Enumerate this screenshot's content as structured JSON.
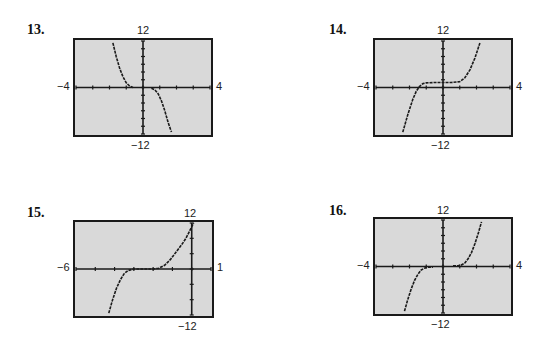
{
  "plot_style": {
    "background": "#d9d9d9",
    "frame": "#1a1a1a",
    "curve": "#1a1a1a",
    "axis": "#1a1a1a"
  },
  "chart_data": [
    {
      "type": "line",
      "label": "13.",
      "title": "",
      "xlim": [
        -4,
        4
      ],
      "ylim": [
        -12,
        12
      ],
      "tick_labels": {
        "xmin": "−4",
        "xmax": "4",
        "ymax": "12",
        "ymin": "−12"
      },
      "x_ticks_step": 1,
      "y_ticks_step": 2,
      "grid": false,
      "series": [
        {
          "name": "left branch",
          "x": [
            -1.8,
            -1.6,
            -1.4,
            -1.2,
            -1.0,
            -0.8,
            -0.6
          ],
          "y": [
            11.5,
            8,
            5,
            2.8,
            1.2,
            0.4,
            0
          ]
        },
        {
          "name": "right branch",
          "x": [
            0.5,
            0.7,
            0.9,
            1.1,
            1.3,
            1.5,
            1.7
          ],
          "y": [
            -0.2,
            -0.6,
            -1.6,
            -3.4,
            -6,
            -9,
            -11.5
          ]
        }
      ]
    },
    {
      "type": "line",
      "label": "14.",
      "title": "",
      "xlim": [
        -4,
        4
      ],
      "ylim": [
        -12,
        12
      ],
      "tick_labels": {
        "xmin": "−4",
        "xmax": "4",
        "ymax": "12",
        "ymin": "−12"
      },
      "x_ticks_step": 1,
      "y_ticks_step": 2,
      "grid": false,
      "series": [
        {
          "name": "curve",
          "x": [
            -2.4,
            -2.1,
            -1.8,
            -1.6,
            -1.4,
            -1.2,
            -1.0,
            -0.5,
            0,
            0.5,
            1.0,
            1.3,
            1.6,
            1.9,
            2.2
          ],
          "y": [
            -11.5,
            -7,
            -3,
            -1,
            0.3,
            1,
            1.2,
            1.3,
            1.3,
            1.3,
            1.5,
            2.5,
            4.5,
            7.5,
            11.5
          ]
        }
      ]
    },
    {
      "type": "line",
      "label": "15.",
      "title": "",
      "xlim": [
        -6,
        1
      ],
      "ylim": [
        -12,
        12
      ],
      "tick_labels": {
        "xmin": "−6",
        "xmax": "1",
        "ymax": "12",
        "ymin": "−12"
      },
      "x_ticks_step": 1,
      "y_ticks_step": 4,
      "grid": false,
      "series": [
        {
          "name": "curve",
          "x": [
            -4.3,
            -4.1,
            -3.9,
            -3.7,
            -3.5,
            -3.3,
            -3.0,
            -2.5,
            -2.0,
            -1.7,
            -1.4,
            -1.1,
            -0.8,
            -0.5,
            -0.3,
            -0.1,
            0.1
          ],
          "y": [
            -11.5,
            -8,
            -5,
            -2.8,
            -1.2,
            -0.4,
            0,
            0,
            0,
            0.2,
            1,
            2.5,
            4.5,
            6.5,
            8,
            10,
            12
          ]
        }
      ]
    },
    {
      "type": "line",
      "label": "16.",
      "title": "",
      "xlim": [
        -4,
        4
      ],
      "ylim": [
        -12,
        12
      ],
      "tick_labels": {
        "xmin": "−4",
        "xmax": "4",
        "ymax": "12",
        "ymin": "−12"
      },
      "x_ticks_step": 1,
      "y_ticks_step": 2,
      "grid": false,
      "series": [
        {
          "name": "left branch",
          "x": [
            -2.3,
            -2.1,
            -1.9,
            -1.7,
            -1.5,
            -1.3,
            -1.1,
            -0.9,
            -0.6
          ],
          "y": [
            -11.5,
            -8.5,
            -5.8,
            -3.6,
            -2,
            -0.9,
            -0.4,
            -0.2,
            -0.2
          ]
        },
        {
          "name": "right branch",
          "x": [
            0.6,
            0.9,
            1.1,
            1.3,
            1.5,
            1.7,
            1.9,
            2.1,
            2.3
          ],
          "y": [
            0.2,
            0.2,
            0.4,
            0.9,
            2,
            3.6,
            5.8,
            8.5,
            11.5
          ]
        }
      ]
    }
  ],
  "panels": [
    {
      "label": "13.",
      "ymax": "12",
      "ymin": "−12",
      "xmin": "−4",
      "xmax": "4"
    },
    {
      "label": "14.",
      "ymax": "12",
      "ymin": "−12",
      "xmin": "−4",
      "xmax": "4"
    },
    {
      "label": "15.",
      "ymax": "12",
      "ymin": "−12",
      "xmin": "−6",
      "xmax": "1"
    },
    {
      "label": "16.",
      "ymax": "12",
      "ymin": "−12",
      "xmin": "−4",
      "xmax": "4"
    }
  ]
}
